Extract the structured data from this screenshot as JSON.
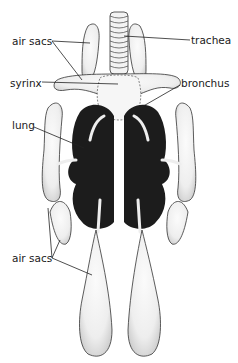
{
  "labels": {
    "air_sacs_top": "air sacs",
    "trachea": "trachea",
    "syrinx": "syrinx",
    "bronchus": "bronchus",
    "lung": "lung",
    "air_sacs_bottom": "air sacs"
  },
  "colors": {
    "background": "#ffffff",
    "ink": "#1a1a1a",
    "lung_fill": "#1c1c1c",
    "sac_fill": "#f4f4f4"
  }
}
